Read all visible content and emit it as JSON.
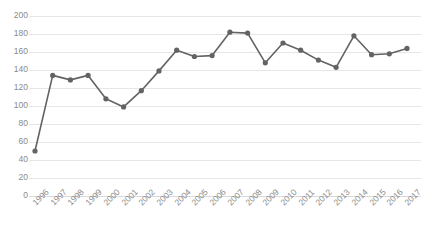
{
  "chart_data": {
    "type": "line",
    "title": "",
    "xlabel": "",
    "ylabel": "",
    "grid": true,
    "legend": false,
    "line_color": "#636363",
    "marker_color": "#636363",
    "grid_color": "#e6e6e6",
    "tick_label_color": "#8a8a8a",
    "xlim": [
      "1996",
      "2017"
    ],
    "ylim": [
      0,
      200
    ],
    "ytick_step": 20,
    "yticks": [
      0,
      20,
      40,
      60,
      80,
      100,
      120,
      140,
      160,
      180,
      200
    ],
    "ytick_labels": [
      "0",
      "20",
      "40",
      "60",
      "80",
      "100",
      "120",
      "140",
      "160",
      "180",
      "200"
    ],
    "categories": [
      "1996",
      "1997",
      "1998",
      "1999",
      "2000",
      "2001",
      "2002",
      "2003",
      "2004",
      "2005",
      "2006",
      "2007",
      "2008",
      "2009",
      "2010",
      "2011",
      "2012",
      "2013",
      "2014",
      "2015",
      "2016",
      "2017"
    ],
    "values": [
      50,
      134,
      129,
      134,
      108,
      99,
      117,
      139,
      162,
      155,
      156,
      182,
      181,
      148,
      170,
      162,
      151,
      143,
      178,
      157,
      158,
      164
    ],
    "series": [
      {
        "name": "series-1",
        "values": [
          50,
          134,
          129,
          134,
          108,
          99,
          117,
          139,
          162,
          155,
          156,
          182,
          181,
          148,
          170,
          162,
          151,
          143,
          178,
          157,
          158,
          164
        ]
      }
    ]
  }
}
